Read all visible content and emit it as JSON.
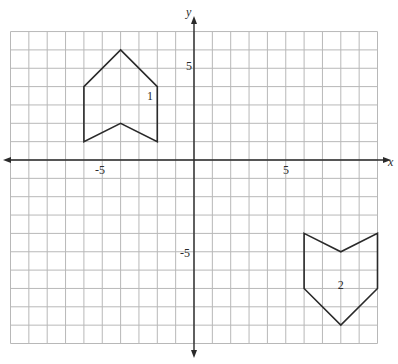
{
  "diagram": {
    "type": "coordinate-grid",
    "axes": {
      "x_label": "x",
      "y_label": "y",
      "x_range": [
        -10,
        10
      ],
      "y_range": [
        -10,
        7
      ],
      "ticks_labeled": {
        "x_neg5": "-5",
        "x_pos5": "5",
        "y_pos5": "5",
        "y_neg5": "-5"
      }
    },
    "figures": [
      {
        "label": "1",
        "vertices": [
          [
            -4,
            6
          ],
          [
            -2,
            4
          ],
          [
            -2,
            1
          ],
          [
            -4,
            2
          ],
          [
            -6,
            1
          ],
          [
            -6,
            4
          ]
        ],
        "label_pos": [
          -2.4,
          3.5
        ]
      },
      {
        "label": "2",
        "vertices": [
          [
            6,
            -4
          ],
          [
            8,
            -5
          ],
          [
            10,
            -4
          ],
          [
            10,
            -7
          ],
          [
            8,
            -9
          ],
          [
            6,
            -7
          ]
        ],
        "label_pos": [
          8,
          -6.8
        ]
      }
    ],
    "colors": {
      "grid": "#b8b8b8",
      "ink": "#2a2a2a",
      "background": "#ffffff"
    }
  }
}
